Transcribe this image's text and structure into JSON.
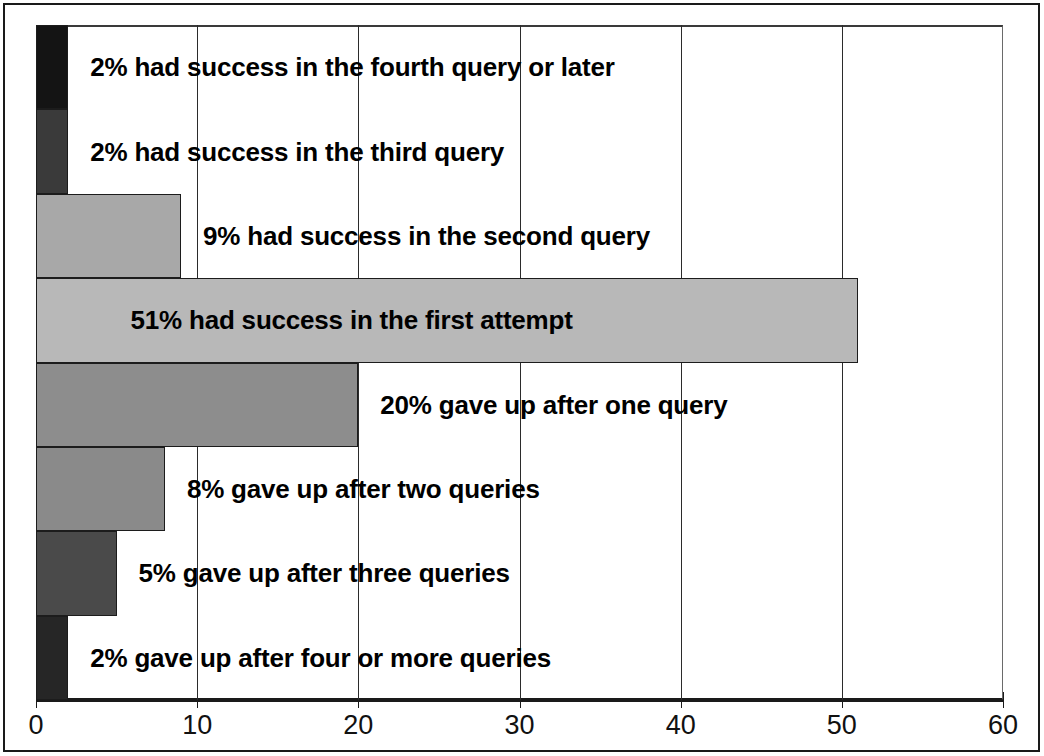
{
  "chart_data": {
    "type": "bar",
    "orientation": "horizontal",
    "title": "",
    "xlabel": "",
    "ylabel": "",
    "xlim": [
      0,
      60
    ],
    "xticks": [
      0,
      10,
      20,
      30,
      40,
      50,
      60
    ],
    "xtick_labels": [
      "0",
      "10",
      "20",
      "30",
      "40",
      "50",
      "60"
    ],
    "grid": "vertical-dashed",
    "legend": "none",
    "value_unit": "percent",
    "categories": [
      "had success in the fourth query or later",
      "had success in the third query",
      "had success in the second query",
      "had success in the first attempt",
      "gave up after one query",
      "gave up after two queries",
      "gave up after three queries",
      "gave up after four or more queries"
    ],
    "values": [
      2,
      2,
      9,
      51,
      20,
      8,
      5,
      2
    ],
    "annotations": [
      "2% had success in the fourth query or later",
      "2% had success in the third query",
      "9% had success in the second query",
      "51% had success in the first attempt",
      "20% gave up after one query",
      "8% gave up after two queries",
      "5% gave up after three queries",
      "2% gave up after four or more queries"
    ],
    "bar_colors": [
      "#141414",
      "#3a3a3a",
      "#a8a8a8",
      "#b8b8b8",
      "#8d8d8d",
      "#8a8a8a",
      "#4a4a4a",
      "#262626"
    ],
    "bar_edge_color": "#1c1c1c"
  },
  "bars": [
    {
      "label": "2% had success in the fourth query or later",
      "value": 2,
      "color": "#141414",
      "label_inside": false
    },
    {
      "label": "2% had success in the third query",
      "value": 2,
      "color": "#3a3a3a",
      "label_inside": false
    },
    {
      "label": "9% had success in the second query",
      "value": 9,
      "color": "#a8a8a8",
      "label_inside": false
    },
    {
      "label": "51% had success in the first attempt",
      "value": 51,
      "color": "#b8b8b8",
      "label_inside": true
    },
    {
      "label": "20% gave up after one query",
      "value": 20,
      "color": "#8d8d8d",
      "label_inside": false
    },
    {
      "label": "8% gave up after two queries",
      "value": 8,
      "color": "#8a8a8a",
      "label_inside": false
    },
    {
      "label": "5% gave up after three queries",
      "value": 5,
      "color": "#4a4a4a",
      "label_inside": false
    },
    {
      "label": "2% gave up after four or more queries",
      "value": 2,
      "color": "#262626",
      "label_inside": false
    }
  ],
  "axis": {
    "ticks": [
      "0",
      "10",
      "20",
      "30",
      "40",
      "50",
      "60"
    ]
  }
}
